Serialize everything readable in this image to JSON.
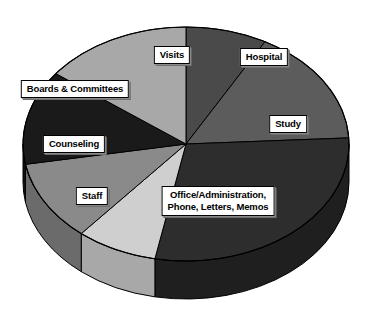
{
  "chart_data": {
    "type": "pie",
    "title": "",
    "subtitle": "",
    "xlabel": "",
    "ylabel": "",
    "legend_position": "none",
    "grid": false,
    "style": "3d-exploded-none",
    "center": {
      "x": 186,
      "y": 144
    },
    "radius": {
      "rx": 163,
      "ry": 117
    },
    "depth": 38,
    "start_angle_deg": -90,
    "direction": "clockwise",
    "categories": [
      "Hospital",
      "Study",
      "Office/Administration, Phone, Letters, Memos",
      "Staff",
      "Counseling",
      "Boards & Committees",
      "Visits"
    ],
    "values": [
      8,
      16,
      29,
      8,
      11,
      13,
      15
    ],
    "slices": [
      {
        "label": "Hospital",
        "value": 8,
        "percent": 8,
        "color": "#4a4a4a",
        "side_color": "#333333",
        "start_deg": -90,
        "end_deg": -61,
        "label_pos": {
          "x": 264,
          "y": 57
        }
      },
      {
        "label": "Study",
        "value": 16,
        "percent": 16,
        "color": "#5c5c5c",
        "side_color": "#3f3f3f",
        "start_deg": -61,
        "end_deg": -3,
        "label_pos": {
          "x": 288,
          "y": 124
        }
      },
      {
        "label": "Office/Administration, Phone, Letters, Memos",
        "label_lines": [
          "Office/Administration,",
          "Phone, Letters, Memos"
        ],
        "value": 29,
        "percent": 29,
        "color": "#2d2d2d",
        "side_color": "#1f1f1f",
        "start_deg": -3,
        "end_deg": 101,
        "label_pos": {
          "x": 218,
          "y": 201
        }
      },
      {
        "label": "Staff",
        "value": 8,
        "percent": 8,
        "color": "#cfcfcf",
        "side_color": "#a8a8a8",
        "start_deg": 101,
        "end_deg": 130,
        "label_pos": {
          "x": 92,
          "y": 196
        }
      },
      {
        "label": "Counseling",
        "value": 11,
        "percent": 11,
        "color": "#8a8a8a",
        "side_color": "#6b6b6b",
        "start_deg": 130,
        "end_deg": 170,
        "label_pos": {
          "x": 74,
          "y": 144
        }
      },
      {
        "label": "Boards & Committees",
        "value": 13,
        "percent": 13,
        "color": "#1a1a1a",
        "side_color": "#111111",
        "start_deg": 170,
        "end_deg": 217,
        "label_pos": {
          "x": 75,
          "y": 89
        }
      },
      {
        "label": "Visits",
        "value": 15,
        "percent": 15,
        "color": "#a8a8a8",
        "side_color": "#858585",
        "start_deg": 217,
        "end_deg": 270,
        "label_pos": {
          "x": 172,
          "y": 55
        }
      }
    ]
  },
  "labels": {
    "visits": "Visits",
    "hospital": "Hospital",
    "study": "Study",
    "office_line1": "Office/Administration,",
    "office_line2": "Phone, Letters, Memos",
    "staff": "Staff",
    "counseling": "Counseling",
    "boards": "Boards & Committees"
  },
  "colors": {
    "background": "#ffffff",
    "outline": "#000000",
    "label_box_background": "#ffffff",
    "label_text": "#000000",
    "label_shadow": "#808080"
  }
}
